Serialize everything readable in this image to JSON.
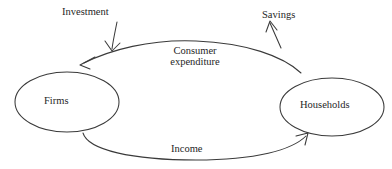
{
  "diagram": {
    "type": "circular-flow",
    "background_color": "#ffffff",
    "line_color": "#3a3a3a",
    "text_color": "#262626",
    "nodes": [
      {
        "id": "firms",
        "label": "Firms",
        "shape": "ellipse",
        "cx": 67,
        "cy": 102,
        "rx": 52,
        "ry": 30
      },
      {
        "id": "households",
        "label": "Households",
        "shape": "ellipse",
        "cx": 332,
        "cy": 107,
        "rx": 52,
        "ry": 29
      }
    ],
    "flows": [
      {
        "id": "consumer-expenditure",
        "label": "Consumer expenditure",
        "label_line_1": "Consumer",
        "label_line_2": "expenditure",
        "from": "households",
        "to": "firms",
        "direction": "right-to-left",
        "arrowhead": true
      },
      {
        "id": "income",
        "label": "Income",
        "from": "firms",
        "to": "households",
        "direction": "left-to-right",
        "arrowhead": true
      }
    ],
    "injections": [
      {
        "id": "investment",
        "label": "Investment",
        "kind": "injection",
        "direction": "into-flow",
        "target_flow": "consumer-expenditure"
      }
    ],
    "withdrawals": [
      {
        "id": "savings",
        "label": "Savings",
        "kind": "withdrawal",
        "direction": "out-of-flow",
        "source_flow": "consumer-expenditure"
      }
    ]
  }
}
